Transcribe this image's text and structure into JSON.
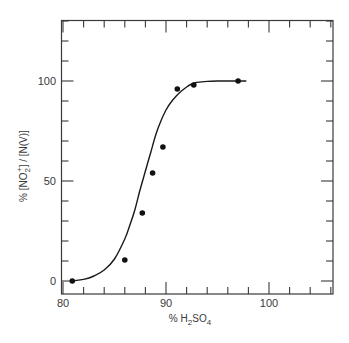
{
  "chart_data": {
    "type": "scatter",
    "title": "",
    "xlabel": "% H2SO4",
    "xlabel_parts": {
      "pre": "% H",
      "sub1": "2",
      "mid": "SO",
      "sub2": "4"
    },
    "ylabel": "% [NO2+] / [N(V)]",
    "ylabel_parts": {
      "pre": "% [NO",
      "sub": "2",
      "sup": "+",
      "post": "] / [N(V)]"
    },
    "xlim": [
      80,
      106
    ],
    "ylim": [
      -6,
      130
    ],
    "x_ticks_major": [
      80,
      90,
      100
    ],
    "x_tick_labels": [
      "80",
      "90",
      "100"
    ],
    "x_ticks_minor_step": 2,
    "y_ticks_major": [
      0,
      50,
      100
    ],
    "y_tick_labels": [
      "0",
      "50",
      "100"
    ],
    "y_ticks_minor_step": 10,
    "grid": false,
    "legend": null,
    "series": [
      {
        "name": "measured",
        "kind": "points",
        "x": [
          80.9,
          86.0,
          87.7,
          88.7,
          89.7,
          91.1,
          92.7,
          97.0
        ],
        "y": [
          0,
          10.5,
          34,
          54,
          67,
          96,
          98,
          100
        ]
      },
      {
        "name": "fitted curve",
        "kind": "line",
        "x": [
          80.9,
          82.0,
          83.0,
          84.0,
          85.0,
          86.0,
          86.5,
          87.0,
          87.5,
          88.0,
          88.5,
          89.0,
          89.5,
          90.0,
          90.5,
          91.0,
          91.5,
          92.0,
          92.5,
          93.0,
          94.0,
          95.0,
          96.0,
          97.8
        ],
        "y": [
          0,
          0.8,
          2.5,
          5.5,
          11,
          21,
          28,
          36,
          46,
          55,
          64,
          73,
          80,
          85.5,
          89.5,
          92.5,
          95,
          97,
          98.5,
          99.3,
          99.8,
          100,
          100,
          100
        ]
      }
    ]
  }
}
